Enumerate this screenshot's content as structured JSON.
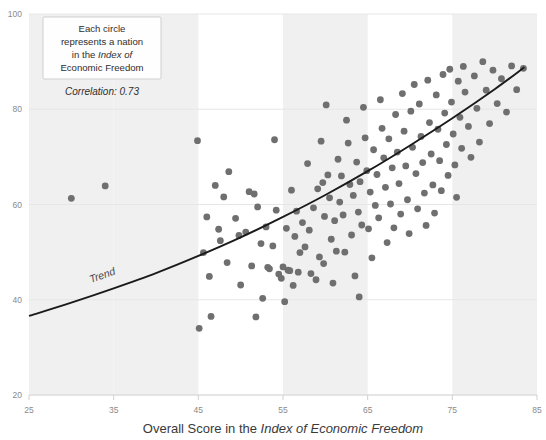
{
  "chart_data": {
    "type": "scatter",
    "title": "",
    "xlabel_parts": [
      {
        "text": "Overall Score in the ",
        "italic": false
      },
      {
        "text": "Index of Economic Freedom",
        "italic": true
      }
    ],
    "xlabel": "Overall Score in the Index of Economic Freedom",
    "ylabel": "",
    "xlim": [
      25,
      85
    ],
    "ylim": [
      20,
      100
    ],
    "xticks": [
      25,
      35,
      45,
      55,
      65,
      75,
      85
    ],
    "yticks": [
      20,
      40,
      60,
      80,
      100
    ],
    "grid": "horizontal-gridlines-with-alternating-vertical-bands",
    "legend": "none",
    "correlation": 0.73,
    "correlation_label": "Correlation: 0.73",
    "annotation_lines": [
      {
        "text": "Each circle",
        "italic": false
      },
      {
        "text": "represents a nation",
        "italic": false
      },
      {
        "text": "in the ",
        "italic": false,
        "tail": "Index of",
        "tail_italic": true
      },
      {
        "text": "Economic Freedom",
        "italic": true
      }
    ],
    "annotation_text": "Each circle represents a nation in the Index of Economic Freedom",
    "trend_label": "Trend",
    "trend_curve": [
      [
        25,
        36.6
      ],
      [
        30,
        39.4
      ],
      [
        35,
        42.4
      ],
      [
        40,
        45.6
      ],
      [
        45,
        49.2
      ],
      [
        50,
        53.1
      ],
      [
        55,
        57.4
      ],
      [
        60,
        62.0
      ],
      [
        65,
        67.0
      ],
      [
        70,
        72.4
      ],
      [
        75,
        78.1
      ],
      [
        80,
        84.2
      ],
      [
        83.5,
        88.8
      ]
    ],
    "colors": {
      "point": "#6f6f6f",
      "trend": "#1a1a1a",
      "band": "#f0f0f0",
      "grid": "#e6e6e6",
      "tick_text": "#8a8a8a",
      "axis_title": "#3a3a3a",
      "note_border": "#cfcfcf"
    },
    "point_radius": 3.4,
    "n_points": 154,
    "points": [
      [
        30.0,
        61.3
      ],
      [
        34.0,
        63.9
      ],
      [
        44.9,
        73.4
      ],
      [
        45.1,
        34.0
      ],
      [
        45.6,
        49.9
      ],
      [
        46.0,
        57.4
      ],
      [
        46.3,
        44.9
      ],
      [
        46.5,
        36.5
      ],
      [
        47.0,
        64.0
      ],
      [
        47.4,
        54.8
      ],
      [
        47.6,
        52.4
      ],
      [
        48.0,
        61.6
      ],
      [
        48.4,
        47.8
      ],
      [
        48.6,
        66.9
      ],
      [
        49.4,
        57.1
      ],
      [
        49.8,
        53.5
      ],
      [
        50.0,
        43.1
      ],
      [
        50.6,
        54.2
      ],
      [
        51.0,
        62.7
      ],
      [
        51.3,
        47.1
      ],
      [
        51.6,
        62.2
      ],
      [
        52.0,
        59.5
      ],
      [
        52.4,
        51.8
      ],
      [
        52.6,
        40.3
      ],
      [
        53.0,
        55.3
      ],
      [
        53.2,
        46.8
      ],
      [
        53.4,
        46.5
      ],
      [
        53.8,
        51.3
      ],
      [
        54.0,
        73.6
      ],
      [
        54.2,
        58.8
      ],
      [
        54.5,
        45.4
      ],
      [
        54.8,
        44.5
      ],
      [
        55.0,
        46.9
      ],
      [
        55.2,
        39.6
      ],
      [
        55.4,
        55.0
      ],
      [
        55.6,
        46.2
      ],
      [
        55.8,
        46.1
      ],
      [
        56.0,
        63.0
      ],
      [
        56.2,
        43.0
      ],
      [
        56.4,
        53.3
      ],
      [
        56.6,
        58.6
      ],
      [
        56.8,
        45.8
      ],
      [
        57.0,
        49.9
      ],
      [
        57.3,
        56.2
      ],
      [
        57.6,
        51.1
      ],
      [
        57.9,
        68.6
      ],
      [
        58.1,
        54.6
      ],
      [
        58.3,
        45.5
      ],
      [
        58.6,
        59.3
      ],
      [
        58.9,
        44.2
      ],
      [
        59.1,
        63.3
      ],
      [
        59.3,
        49.0
      ],
      [
        59.5,
        73.3
      ],
      [
        59.7,
        64.6
      ],
      [
        59.9,
        57.5
      ],
      [
        60.1,
        80.9
      ],
      [
        60.3,
        66.2
      ],
      [
        60.5,
        61.4
      ],
      [
        60.7,
        52.7
      ],
      [
        60.9,
        43.5
      ],
      [
        61.1,
        56.6
      ],
      [
        61.3,
        50.2
      ],
      [
        61.5,
        69.5
      ],
      [
        61.7,
        60.5
      ],
      [
        61.9,
        66.0
      ],
      [
        62.1,
        57.8
      ],
      [
        62.3,
        50.0
      ],
      [
        62.5,
        77.7
      ],
      [
        62.7,
        72.9
      ],
      [
        62.9,
        64.2
      ],
      [
        63.1,
        53.6
      ],
      [
        63.3,
        61.9
      ],
      [
        63.5,
        45.0
      ],
      [
        63.7,
        68.9
      ],
      [
        63.9,
        58.4
      ],
      [
        64.1,
        64.8
      ],
      [
        64.3,
        55.7
      ],
      [
        64.5,
        80.4
      ],
      [
        64.7,
        74.0
      ],
      [
        64.9,
        67.1
      ],
      [
        65.1,
        54.9
      ],
      [
        65.3,
        62.6
      ],
      [
        65.5,
        48.8
      ],
      [
        65.7,
        71.5
      ],
      [
        65.9,
        59.8
      ],
      [
        66.1,
        66.3
      ],
      [
        66.3,
        57.2
      ],
      [
        66.5,
        82.0
      ],
      [
        66.7,
        76.0
      ],
      [
        66.9,
        69.8
      ],
      [
        67.1,
        63.6
      ],
      [
        67.3,
        52.0
      ],
      [
        67.5,
        73.8
      ],
      [
        67.7,
        60.1
      ],
      [
        67.9,
        67.7
      ],
      [
        68.1,
        55.1
      ],
      [
        68.3,
        78.9
      ],
      [
        68.5,
        71.0
      ],
      [
        68.7,
        64.4
      ],
      [
        68.9,
        58.0
      ],
      [
        69.1,
        83.3
      ],
      [
        69.3,
        75.4
      ],
      [
        69.5,
        68.1
      ],
      [
        69.7,
        61.0
      ],
      [
        69.9,
        53.9
      ],
      [
        70.1,
        79.6
      ],
      [
        70.3,
        72.0
      ],
      [
        70.5,
        85.2
      ],
      [
        70.7,
        66.5
      ],
      [
        70.9,
        59.1
      ],
      [
        71.1,
        81.1
      ],
      [
        71.3,
        74.3
      ],
      [
        71.5,
        68.8
      ],
      [
        71.7,
        62.4
      ],
      [
        71.9,
        55.6
      ],
      [
        72.1,
        86.1
      ],
      [
        72.3,
        77.2
      ],
      [
        72.5,
        70.6
      ],
      [
        72.7,
        64.1
      ],
      [
        72.9,
        58.2
      ],
      [
        73.1,
        83.0
      ],
      [
        73.3,
        75.8
      ],
      [
        73.5,
        69.2
      ],
      [
        73.7,
        62.9
      ],
      [
        73.9,
        87.3
      ],
      [
        74.1,
        79.2
      ],
      [
        74.3,
        72.6
      ],
      [
        74.5,
        66.1
      ],
      [
        74.7,
        88.4
      ],
      [
        74.9,
        81.5
      ],
      [
        75.1,
        74.8
      ],
      [
        75.3,
        68.3
      ],
      [
        75.5,
        61.5
      ],
      [
        75.7,
        85.9
      ],
      [
        75.9,
        78.3
      ],
      [
        76.1,
        71.8
      ],
      [
        76.3,
        89.0
      ],
      [
        76.5,
        83.6
      ],
      [
        76.9,
        76.4
      ],
      [
        77.2,
        69.9
      ],
      [
        77.6,
        87.0
      ],
      [
        77.9,
        80.2
      ],
      [
        78.2,
        73.1
      ],
      [
        78.6,
        90.0
      ],
      [
        79.0,
        84.0
      ],
      [
        79.4,
        77.0
      ],
      [
        79.8,
        88.2
      ],
      [
        80.3,
        81.2
      ],
      [
        80.8,
        86.4
      ],
      [
        81.4,
        79.4
      ],
      [
        82.0,
        89.1
      ],
      [
        82.6,
        84.1
      ],
      [
        83.4,
        88.6
      ],
      [
        51.8,
        36.4
      ],
      [
        59.8,
        47.6
      ],
      [
        64.0,
        40.6
      ]
    ]
  }
}
